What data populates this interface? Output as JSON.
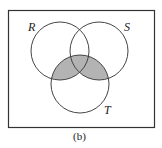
{
  "diagram": {
    "type": "venn",
    "sets": [
      {
        "name": "R",
        "label": "R",
        "cx": 60,
        "cy": 51,
        "r": 29
      },
      {
        "name": "S",
        "label": "S",
        "cx": 99,
        "cy": 51,
        "r": 29
      },
      {
        "name": "T",
        "label": "T",
        "cx": 80,
        "cy": 84,
        "r": 29
      }
    ],
    "shaded_region": "(R ∪ S) ∩ T",
    "shade_color": "#b3b3b3",
    "stroke_color": "#444444",
    "caption": "(b)"
  }
}
